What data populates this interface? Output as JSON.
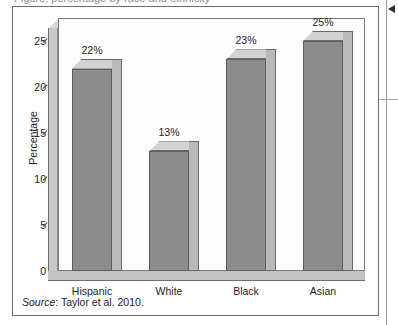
{
  "figure": {
    "caption_stub": "Figure: percentage by race and ethnicity",
    "source_word": "Source",
    "source_rest": ": Taylor et al. 2010.",
    "margin_arrow_icon": "left-triangle-marker-icon"
  },
  "chart_data": {
    "type": "bar",
    "title": "",
    "subtitle": "",
    "xlabel": "",
    "ylabel": "Percentage",
    "categories": [
      "Hispanic",
      "White",
      "Black",
      "Asian"
    ],
    "values": [
      22,
      13,
      23,
      25
    ],
    "value_labels": [
      "22%",
      "13%",
      "23%",
      "25%"
    ],
    "ylim": [
      0,
      27.5
    ],
    "yticks": [
      0,
      5,
      10,
      15,
      20,
      25
    ],
    "ytick_labels": [
      "0",
      "5",
      "10",
      "15",
      "20",
      "25"
    ],
    "grid": false,
    "legend": "none",
    "style": "3d-column",
    "bar_color": "#8c8c8c",
    "bar_side_color": "#b9b9b9",
    "bar_top_color": "#d2d2d2",
    "plot_background": "#fdfdfd",
    "axis_color": "#5f5f5f"
  }
}
